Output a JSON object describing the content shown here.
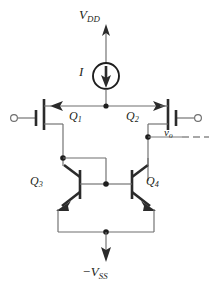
{
  "figure": {
    "kind": "circuit-schematic",
    "title_text": "",
    "background_color": "#ffffff",
    "wire_color": "#6e6e6e",
    "device_color": "#2b2b2b",
    "label_color": "#231f20"
  },
  "labels": {
    "supply_top": {
      "symbol": "V",
      "subscript": "DD",
      "prefix": ""
    },
    "supply_bottom": {
      "symbol": "V",
      "subscript": "SS",
      "prefix": "−"
    },
    "current_source": {
      "symbol": "I",
      "subscript": ""
    },
    "q1": {
      "symbol": "Q",
      "subscript": "1"
    },
    "q2": {
      "symbol": "Q",
      "subscript": "2"
    },
    "q3": {
      "symbol": "Q",
      "subscript": "3"
    },
    "q4": {
      "symbol": "Q",
      "subscript": "4"
    },
    "output": {
      "symbol": "v",
      "subscript": "o"
    }
  },
  "components": [
    {
      "name": "current-source-I",
      "type": "current-source",
      "label": "I",
      "arrow_direction": "down"
    },
    {
      "name": "mosfet-q1",
      "type": "mosfet-pmos",
      "label": "Q1",
      "arrow_direction": "left",
      "terminal": "input-left"
    },
    {
      "name": "mosfet-q2",
      "type": "mosfet-pmos",
      "label": "Q2",
      "arrow_direction": "right",
      "terminal": "input-right"
    },
    {
      "name": "bjt-q3",
      "type": "bjt-npn",
      "label": "Q3",
      "orientation": "normal"
    },
    {
      "name": "bjt-q4",
      "type": "bjt-npn",
      "label": "Q4",
      "orientation": "mirrored"
    }
  ],
  "terminals": [
    {
      "name": "input-terminal-left",
      "shape": "open-circle",
      "side": "left"
    },
    {
      "name": "input-terminal-right",
      "shape": "open-circle",
      "side": "right"
    },
    {
      "name": "output-node",
      "shape": "filled-dot",
      "label": "v_o"
    }
  ],
  "nodes": [
    {
      "name": "top-rail-node",
      "x": 106,
      "y": 106
    },
    {
      "name": "q3-collector-node",
      "x": 63,
      "y": 158
    },
    {
      "name": "base-common-node",
      "x": 106,
      "y": 181
    },
    {
      "name": "output-node",
      "x": 148,
      "y": 137
    },
    {
      "name": "emitter-rail-node",
      "x": 106,
      "y": 232
    }
  ],
  "annotations": {
    "output_dashed_line": "dashed-continuation-right"
  }
}
